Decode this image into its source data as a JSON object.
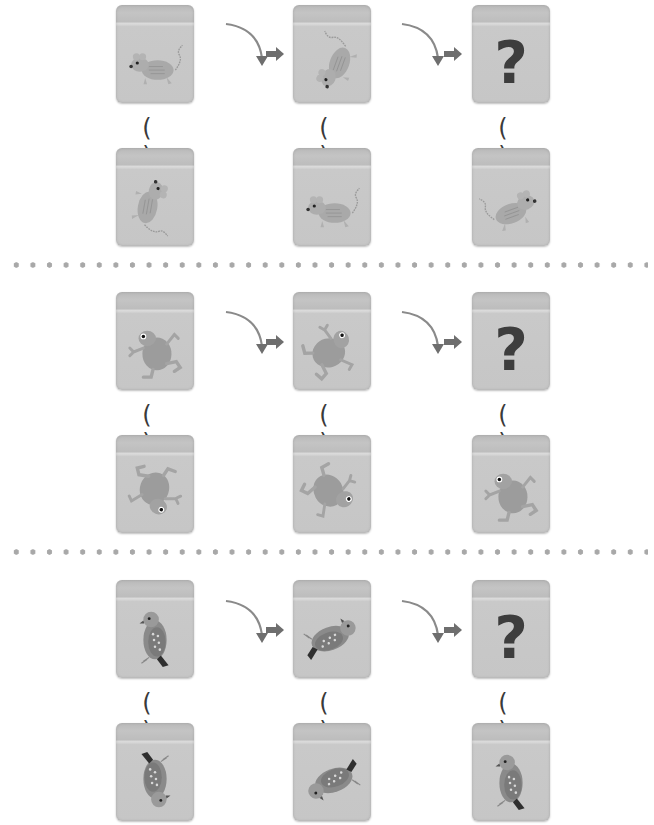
{
  "puzzle_groups": [
    {
      "animal": "rat",
      "sequence": [
        {
          "animal": "rat",
          "rotation_deg": 0
        },
        {
          "animal": "rat",
          "rotation_deg": -70
        },
        {
          "question_mark": "?"
        }
      ],
      "options": [
        {
          "label": "( )",
          "animal": "rat",
          "rotation_deg": 100
        },
        {
          "label": "( )",
          "animal": "rat",
          "rotation_deg": 180,
          "flip": true
        },
        {
          "label": "( )",
          "animal": "rat",
          "rotation_deg": 160
        }
      ]
    },
    {
      "animal": "frog",
      "sequence": [
        {
          "animal": "frog",
          "rotation_deg": 0
        },
        {
          "animal": "frog",
          "rotation_deg": 75
        },
        {
          "question_mark": "?"
        }
      ],
      "options": [
        {
          "label": "( )",
          "animal": "frog",
          "rotation_deg": 200
        },
        {
          "label": "( )",
          "animal": "frog",
          "rotation_deg": 150
        },
        {
          "label": "( )",
          "animal": "frog",
          "rotation_deg": 0
        }
      ]
    },
    {
      "animal": "bird",
      "sequence": [
        {
          "animal": "bird",
          "rotation_deg": 0
        },
        {
          "animal": "bird",
          "rotation_deg": 70
        },
        {
          "question_mark": "?"
        }
      ],
      "options": [
        {
          "label": "( )",
          "animal": "bird",
          "rotation_deg": 180
        },
        {
          "label": "( )",
          "animal": "bird",
          "rotation_deg": 250
        },
        {
          "label": "( )",
          "animal": "bird",
          "rotation_deg": 0
        }
      ]
    }
  ],
  "labels": {
    "question_mark": "?",
    "blank": "( )"
  },
  "colors": {
    "cube": "#c6c6c6",
    "cube_top": "#b9b9b9",
    "arrow": "#6e6e6e",
    "question_mark": "#3d3d3d",
    "dots": "#a8a8a8"
  }
}
